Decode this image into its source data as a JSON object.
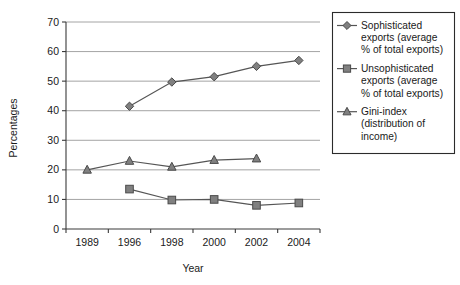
{
  "chart_data": {
    "type": "line",
    "title": "",
    "xlabel": "Year",
    "ylabel": "Percentages",
    "categories": [
      "1989",
      "1996",
      "1998",
      "2000",
      "2002",
      "2004"
    ],
    "x": [
      1989,
      1996,
      1998,
      2000,
      2002,
      2004
    ],
    "ylim": [
      0,
      70
    ],
    "yticks": [
      "0",
      "10",
      "20",
      "30",
      "40",
      "50",
      "60",
      "70"
    ],
    "ytick_values": [
      0,
      10,
      20,
      30,
      40,
      50,
      60,
      70
    ],
    "grid": true,
    "legend_position": "right",
    "series": [
      {
        "name": "Sophisticated exports (average % of total exports)",
        "legend_label_lines": [
          "Sophisticated",
          "exports (average",
          "% of total exports)"
        ],
        "marker": "diamond",
        "color": "#808080",
        "values": [
          null,
          41.5,
          49.7,
          51.5,
          55.0,
          57.0
        ]
      },
      {
        "name": "Unsophisticated exports (average % of total exports)",
        "legend_label_lines": [
          "Unsophisticated",
          "exports (average",
          "% of total exports)"
        ],
        "marker": "square",
        "color": "#808080",
        "values": [
          null,
          13.5,
          9.8,
          10.0,
          8.0,
          8.8
        ]
      },
      {
        "name": "Gini-index (distribution of income)",
        "legend_label_lines": [
          "Gini-index",
          "(distribution of",
          "income)"
        ],
        "marker": "triangle",
        "color": "#808080",
        "values": [
          20.0,
          23.0,
          21.0,
          23.3,
          23.8,
          null
        ]
      }
    ]
  },
  "colors": {
    "marker_fill": "#808080",
    "marker_stroke": "#4a4a4a",
    "line": "#555555",
    "grid": "#9a9a9a",
    "axis": "#3a3a3a",
    "legend_border": "#2b2b2b",
    "background": "#ffffff"
  }
}
